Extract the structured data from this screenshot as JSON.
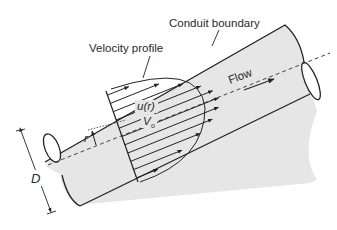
{
  "diagram": {
    "labels": {
      "conduit_boundary": "Conduit boundary",
      "velocity_profile": "Velocity profile",
      "flow": "Flow",
      "local_velocity": "u(r)",
      "centerline_velocity_main": "V",
      "centerline_velocity_sub": "o",
      "radius": "r",
      "diameter": "D"
    },
    "colors": {
      "pipe_fill": "#e6e6e6",
      "line": "#222222",
      "background": "#ffffff"
    },
    "profile": {
      "shape": "parabolic",
      "arrow_count": 11
    }
  }
}
